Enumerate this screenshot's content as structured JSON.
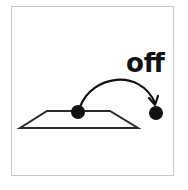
{
  "symbol": {
    "word": "off",
    "description": "A ball moves in an arc off a flat surface",
    "colors": {
      "ink": "#111111",
      "border": "#c8c8c8",
      "background": "#ffffff"
    }
  }
}
